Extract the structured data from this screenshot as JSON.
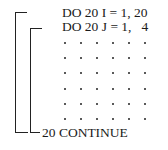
{
  "code": {
    "lines": [
      "DO 20 I = 1, 20",
      "DO 20 J = 1,   4"
    ],
    "end_line": "20 CONTINUE",
    "ellipsis_grid": {
      "rows": 6,
      "cols": 6
    }
  },
  "brackets": [
    {
      "name": "outer-loop-I",
      "x": 15,
      "top": 12,
      "bottom": 133,
      "top_width": 11,
      "bottom_width": 12
    },
    {
      "name": "inner-loop-J",
      "x": 30,
      "top": 28,
      "bottom": 133,
      "top_width": 11,
      "bottom_width": 10
    }
  ]
}
